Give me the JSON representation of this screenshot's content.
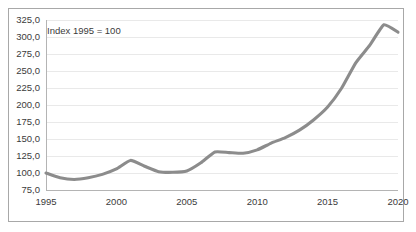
{
  "chart_data": {
    "type": "line",
    "title": "",
    "subtitle": "",
    "annotation": "Index 1995 = 100",
    "xlabel": "",
    "ylabel": "",
    "xlim": [
      1995,
      2020
    ],
    "ylim": [
      75,
      325
    ],
    "grid": true,
    "legend": null,
    "legend_position": "none",
    "line_color": "#8c8c8c",
    "gridline_color": "#e9e9e9",
    "axis_color": "#b4b4b4",
    "text_color": "#3b3b3b",
    "decimal_separator": ",",
    "y_ticks": [
      75,
      100,
      125,
      150,
      175,
      200,
      225,
      250,
      275,
      300,
      325
    ],
    "y_tick_labels": [
      "75,0",
      "100,0",
      "125,0",
      "150,0",
      "175,0",
      "200,0",
      "225,0",
      "250,0",
      "275,0",
      "300,0",
      "325,0"
    ],
    "x_ticks": [
      1995,
      2000,
      2005,
      2010,
      2015,
      2020
    ],
    "x_tick_labels": [
      "1995",
      "2000",
      "2005",
      "2010",
      "2015",
      "2020"
    ],
    "x": [
      1995,
      1996,
      1997,
      1998,
      1999,
      2000,
      2001,
      2002,
      2003,
      2004,
      2005,
      2006,
      2007,
      2008,
      2009,
      2010,
      2011,
      2012,
      2013,
      2014,
      2015,
      2016,
      2017,
      2018,
      2019,
      2020
    ],
    "values": [
      100.0,
      93.0,
      90.5,
      93.0,
      98.0,
      106.0,
      118.5,
      110.0,
      102.0,
      101.0,
      103.0,
      115.0,
      131.0,
      130.0,
      129.0,
      134.0,
      144.0,
      152.0,
      163.0,
      178.0,
      197.0,
      225.0,
      262.0,
      288.0,
      318.0,
      307.0
    ],
    "series": [
      {
        "name": "Index",
        "values": [
          100.0,
          93.0,
          90.5,
          93.0,
          98.0,
          106.0,
          118.5,
          110.0,
          102.0,
          101.0,
          103.0,
          115.0,
          131.0,
          130.0,
          129.0,
          134.0,
          144.0,
          152.0,
          163.0,
          178.0,
          197.0,
          225.0,
          262.0,
          288.0,
          318.0,
          307.0
        ]
      }
    ]
  }
}
